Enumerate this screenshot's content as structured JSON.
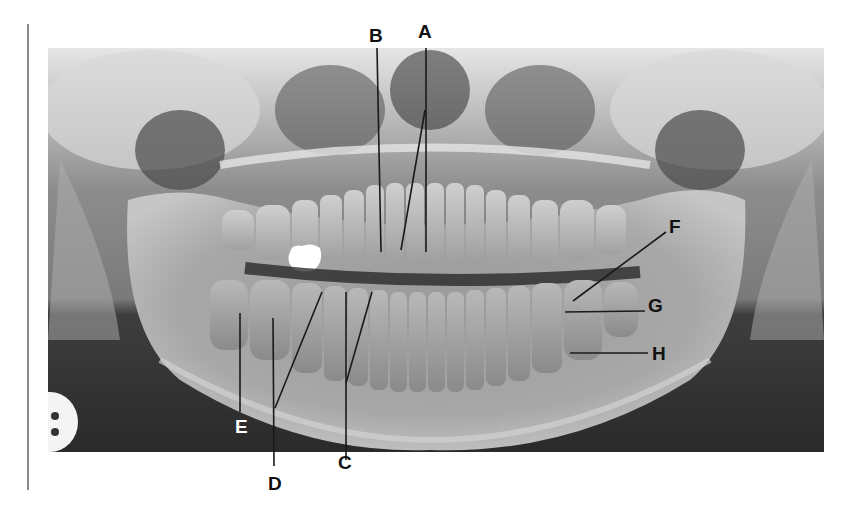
{
  "figure": {
    "type": "panoramic dental radiograph",
    "labels": [
      {
        "id": "A",
        "text": "A",
        "x": 425,
        "y": 38,
        "color": "#111111"
      },
      {
        "id": "B",
        "text": "B",
        "x": 376,
        "y": 42,
        "color": "#111111"
      },
      {
        "id": "C",
        "text": "C",
        "x": 345,
        "y": 469,
        "color": "#111111"
      },
      {
        "id": "D",
        "text": "D",
        "x": 275,
        "y": 490,
        "color": "#111111"
      },
      {
        "id": "E",
        "text": "E",
        "x": 242,
        "y": 433,
        "color": "#ffffff"
      },
      {
        "id": "F",
        "text": "F",
        "x": 676,
        "y": 233,
        "color": "#111111"
      },
      {
        "id": "G",
        "text": "G",
        "x": 655,
        "y": 312,
        "color": "#111111"
      },
      {
        "id": "H",
        "text": "H",
        "x": 659,
        "y": 357,
        "color": "#111111"
      }
    ],
    "colors": {
      "background": "#ffffff",
      "rule": "#8a8a8a",
      "xray_dark": "#2b2b2b",
      "xray_mid": "#7a7a7a",
      "xray_light": "#d8d8d8",
      "restoration": "#ffffff"
    }
  }
}
